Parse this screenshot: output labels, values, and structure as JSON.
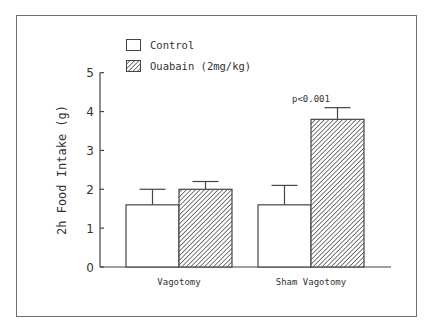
{
  "chart_data": {
    "type": "bar",
    "title": "",
    "xlabel": "",
    "ylabel": "2h Food Intake (g)",
    "ylim": [
      0,
      5
    ],
    "yticks": [
      0,
      1,
      2,
      3,
      4,
      5
    ],
    "grid": false,
    "legend_position": "top-left inside",
    "categories": [
      "Vagotomy",
      "Sham Vagotomy"
    ],
    "series": [
      {
        "name": "Control",
        "pattern": "none",
        "values": [
          1.6,
          1.6
        ],
        "errors": [
          0.4,
          0.5
        ]
      },
      {
        "name": "Ouabain (2mg/kg)",
        "pattern": "diagonal-hatch",
        "values": [
          2.0,
          3.8
        ],
        "errors": [
          0.2,
          0.3
        ]
      }
    ],
    "annotations": [
      {
        "text": "p<0.001",
        "category": "Sham Vagotomy",
        "series": "Ouabain (2mg/kg)"
      }
    ]
  },
  "colors": {
    "axis": "#444444",
    "text": "#333333",
    "bar_fill": "#ffffff",
    "hatch": "#333333",
    "frame": "#6e6e6e"
  }
}
